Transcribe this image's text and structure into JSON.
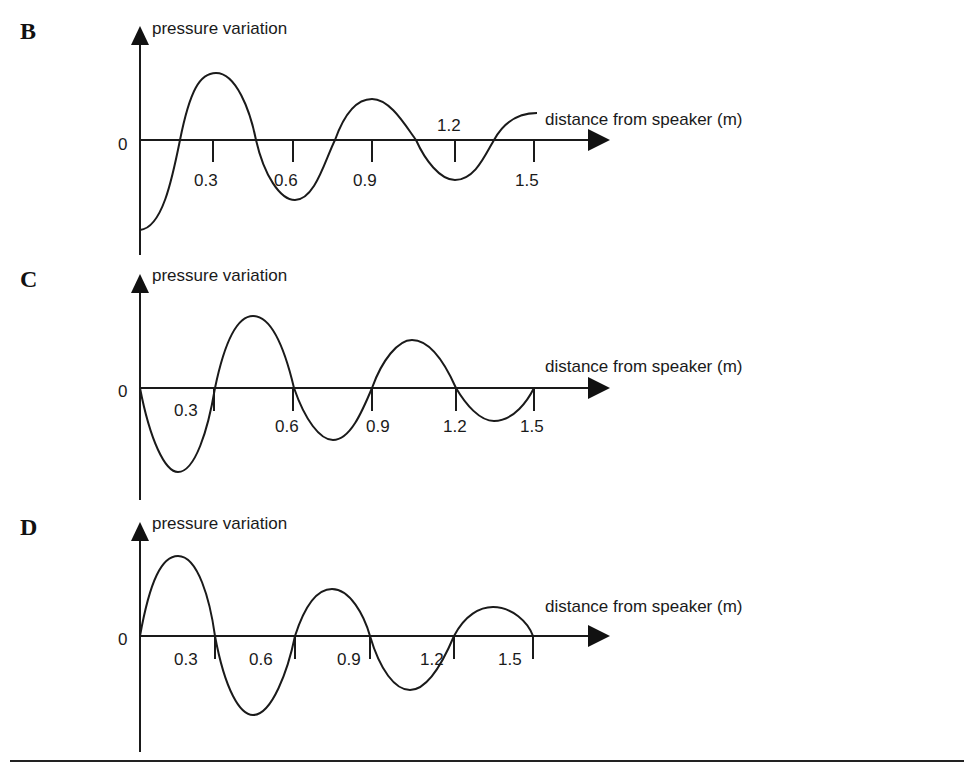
{
  "panels": [
    {
      "letter": "B",
      "y_label": "pressure variation",
      "x_label": "distance from speaker (m)",
      "zero_label": "0",
      "ticks": [
        "0.3",
        "0.6",
        "0.9",
        "1.2",
        "1.5"
      ]
    },
    {
      "letter": "C",
      "y_label": "pressure variation",
      "x_label": "distance from speaker (m)",
      "zero_label": "0",
      "ticks": [
        "0.3",
        "0.6",
        "0.9",
        "1.2",
        "1.5"
      ]
    },
    {
      "letter": "D",
      "y_label": "pressure variation",
      "x_label": "distance from speaker (m)",
      "zero_label": "0",
      "ticks": [
        "0.3",
        "0.6",
        "0.9",
        "1.2",
        "1.5"
      ]
    }
  ],
  "colors": {
    "ink": "#1a1a1a",
    "background": "#ffffff"
  }
}
